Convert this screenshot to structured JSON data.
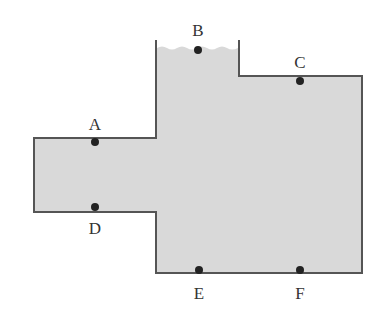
{
  "diagram": {
    "colors": {
      "fill": "#d9d9d9",
      "outline": "#555555",
      "point": "#222222"
    },
    "points": [
      {
        "id": "A",
        "label": "A",
        "x": 95,
        "y": 142,
        "lx": 85,
        "ly": 116
      },
      {
        "id": "B",
        "label": "B",
        "x": 198,
        "y": 50,
        "lx": 188,
        "ly": 22
      },
      {
        "id": "C",
        "label": "C",
        "x": 300,
        "y": 81,
        "lx": 290,
        "ly": 54
      },
      {
        "id": "D",
        "label": "D",
        "x": 95,
        "y": 207,
        "lx": 85,
        "ly": 220
      },
      {
        "id": "E",
        "label": "E",
        "x": 199,
        "y": 270,
        "lx": 189,
        "ly": 285
      },
      {
        "id": "F",
        "label": "F",
        "x": 300,
        "y": 270,
        "lx": 290,
        "ly": 285
      }
    ]
  }
}
